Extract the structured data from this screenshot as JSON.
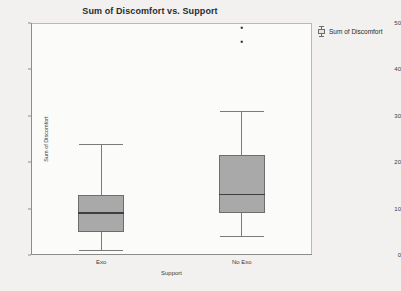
{
  "chart_data": {
    "type": "box",
    "title": "Sum of Discomfort vs. Support",
    "xlabel": "Support",
    "ylabel": "Sum of Discomfort",
    "ylim": [
      0,
      50
    ],
    "yticks": [
      0,
      10,
      20,
      30,
      40,
      50
    ],
    "categories": [
      "Exo",
      "No Exo"
    ],
    "grid": false,
    "legend_position": "right",
    "legend": [
      "Sum of Discomfort"
    ],
    "boxes": [
      {
        "category": "Exo",
        "min": 1,
        "q1": 5,
        "median": 9,
        "q3": 13,
        "max": 24,
        "outliers": []
      },
      {
        "category": "No Exo",
        "min": 4,
        "q1": 9,
        "median": 13,
        "q3": 21.5,
        "max": 31,
        "outliers": [
          46,
          49
        ]
      }
    ]
  },
  "legend": {
    "entries": [
      {
        "label": "Sum of Discomfort",
        "marker": "boxplot-glyph"
      }
    ]
  },
  "colors": {
    "box_fill": "#a9a9a9",
    "box_border": "#6d6d6d",
    "median": "#3f3f3f",
    "whisker": "#7a7a7a",
    "outlier": "#1f1f1f",
    "frame": "#b9b9b9",
    "page_background": "#f2f1ef",
    "plot_background": "#fbfbfa",
    "text": "#2b2b2b"
  }
}
